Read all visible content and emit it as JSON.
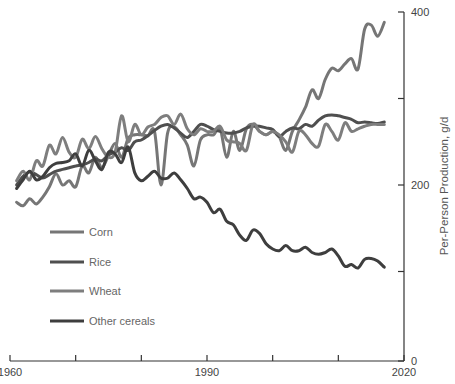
{
  "chart_data": {
    "type": "line",
    "title": "",
    "xlabel": "",
    "ylabel": "Per-Person Production, g/d",
    "xlim": [
      1960,
      2020
    ],
    "ylim": [
      0,
      400
    ],
    "x_ticks": [
      1960,
      1970,
      1980,
      1990,
      2000,
      2010,
      2020
    ],
    "x_tick_labels": [
      "1960",
      "",
      "",
      "1990",
      "",
      "",
      "2020"
    ],
    "y_ticks": [
      0,
      100,
      200,
      300,
      400
    ],
    "y_tick_labels": [
      "0",
      "",
      "200",
      "",
      "400"
    ],
    "y_axis_position": "right",
    "grid": false,
    "legend_position": "lower-left-inside",
    "x": [
      1961,
      1962,
      1963,
      1964,
      1965,
      1966,
      1967,
      1968,
      1969,
      1970,
      1971,
      1972,
      1973,
      1974,
      1975,
      1976,
      1977,
      1978,
      1979,
      1980,
      1981,
      1982,
      1983,
      1984,
      1985,
      1986,
      1987,
      1988,
      1989,
      1990,
      1991,
      1992,
      1993,
      1994,
      1995,
      1996,
      1997,
      1998,
      1999,
      2000,
      2001,
      2002,
      2003,
      2004,
      2005,
      2006,
      2007,
      2008,
      2009,
      2010,
      2011,
      2012,
      2013,
      2014,
      2015,
      2016,
      2017
    ],
    "series": [
      {
        "name": "Corn",
        "color": "#767676",
        "values": [
          180,
          176,
          184,
          178,
          186,
          198,
          213,
          200,
          205,
          198,
          222,
          214,
          232,
          220,
          234,
          248,
          232,
          254,
          258,
          258,
          257,
          262,
          200,
          260,
          267,
          258,
          246,
          222,
          252,
          258,
          258,
          265,
          232,
          262,
          240,
          265,
          270,
          262,
          258,
          262,
          256,
          240,
          262,
          275,
          290,
          310,
          300,
          322,
          335,
          332,
          340,
          346,
          334,
          380,
          385,
          372,
          388
        ]
      },
      {
        "name": "Rice",
        "color": "#4f4f4f",
        "values": [
          200,
          210,
          215,
          212,
          208,
          212,
          216,
          218,
          220,
          222,
          223,
          226,
          230,
          228,
          235,
          238,
          243,
          240,
          250,
          252,
          257,
          263,
          268,
          270,
          266,
          260,
          255,
          262,
          270,
          268,
          264,
          262,
          260,
          260,
          262,
          266,
          268,
          268,
          266,
          264,
          256,
          262,
          266,
          265,
          270,
          268,
          275,
          280,
          281,
          280,
          278,
          276,
          272,
          273,
          272,
          271,
          273
        ]
      },
      {
        "name": "Wheat",
        "color": "#7e7e7e",
        "values": [
          205,
          216,
          206,
          228,
          222,
          246,
          236,
          255,
          238,
          232,
          253,
          242,
          256,
          242,
          232,
          238,
          280,
          250,
          270,
          258,
          267,
          270,
          278,
          280,
          270,
          282,
          265,
          258,
          265,
          262,
          262,
          268,
          252,
          250,
          248,
          240,
          270,
          262,
          258,
          262,
          258,
          250,
          238,
          262,
          258,
          248,
          245,
          270,
          262,
          252,
          272,
          262,
          265,
          268,
          270,
          270,
          270
        ]
      },
      {
        "name": "Other cereals",
        "color": "#3e3e3e",
        "values": [
          196,
          206,
          216,
          206,
          210,
          220,
          225,
          226,
          228,
          236,
          222,
          240,
          228,
          218,
          238,
          236,
          226,
          244,
          214,
          205,
          210,
          216,
          208,
          208,
          214,
          206,
          196,
          184,
          186,
          180,
          168,
          172,
          158,
          154,
          142,
          136,
          148,
          144,
          132,
          126,
          124,
          130,
          124,
          124,
          128,
          122,
          120,
          122,
          126,
          118,
          106,
          108,
          104,
          114,
          115,
          112,
          105
        ]
      }
    ]
  },
  "legend": {
    "items": [
      {
        "label": "Corn",
        "color": "#767676"
      },
      {
        "label": "Rice",
        "color": "#4f4f4f"
      },
      {
        "label": "Wheat",
        "color": "#7e7e7e"
      },
      {
        "label": "Other cereals",
        "color": "#3e3e3e"
      }
    ]
  }
}
